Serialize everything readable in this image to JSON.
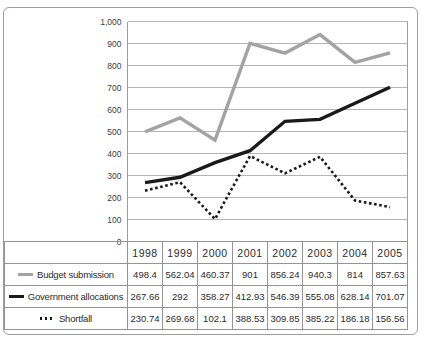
{
  "figure": {
    "background": "#ffffff",
    "border_color": "#9c9c9c"
  },
  "chart_data": {
    "type": "line",
    "title": "",
    "xlabel": "",
    "ylabel": "",
    "categories": [
      "1998",
      "1999",
      "2000",
      "2001",
      "2002",
      "2003",
      "2004",
      "2005"
    ],
    "series": [
      {
        "name": "Budget submission",
        "values": [
          498.4,
          562.04,
          460.37,
          901,
          856.24,
          940.3,
          814,
          857.63
        ],
        "color": "#a3a3a3",
        "dash": "solid"
      },
      {
        "name": "Government allocations",
        "values": [
          267.66,
          292,
          358.27,
          412.93,
          546.39,
          555.08,
          628.14,
          701.07
        ],
        "color": "#1a1a1a",
        "dash": "solid"
      },
      {
        "name": "Shortfall",
        "values": [
          230.74,
          269.68,
          102.1,
          388.53,
          309.85,
          385.22,
          186.18,
          156.56
        ],
        "color": "#1a1a1a",
        "dash": "dotted"
      }
    ],
    "ylim": [
      0,
      1000
    ],
    "ytick_step": 100,
    "ytick_labels": [
      "0",
      "100",
      "200",
      "300",
      "400",
      "500",
      "600",
      "700",
      "800",
      "900",
      "1,000"
    ],
    "grid": true,
    "grid_color": "#b5b5b5",
    "frame_color": "#9c9c9c",
    "tick_text_color": "#3c3c3c",
    "legend_position": "table-left"
  }
}
